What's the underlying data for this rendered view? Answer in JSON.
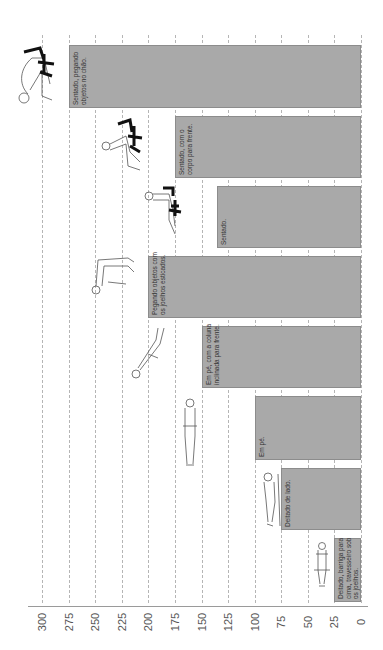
{
  "chart_data": {
    "type": "bar",
    "orientation": "vertical bars, whole figure rotated 90° counter-clockwise",
    "title": "",
    "xlabel": "",
    "ylabel": "",
    "ylim": [
      0,
      300
    ],
    "yticks": [
      0,
      25,
      50,
      75,
      100,
      125,
      150,
      175,
      200,
      225,
      250,
      275,
      300
    ],
    "grid": true,
    "grid_style": "dashed",
    "bar_color": "#a9a9a9",
    "categories": [
      "Deitado, barriga para cima, travesseiro sob os joelhos.",
      "Deitado de lado.",
      "Em pé.",
      "Em pé, com a coluna inclinada para frente.",
      "Pegando objetos com os joelhos esticados.",
      "Sentado.",
      "Sentado, com o corpo para frente.",
      "Sentado, pegando objetos no chão."
    ],
    "values": [
      25,
      75,
      100,
      150,
      200,
      135,
      175,
      275
    ]
  },
  "axis": {
    "ticks": [
      "0",
      "25",
      "50",
      "75",
      "100",
      "125",
      "150",
      "175",
      "200",
      "225",
      "250",
      "275",
      "300"
    ]
  },
  "bars": [
    {
      "label": "Deitado, barriga para\ncima, travesseiro sob\nos joelhos.",
      "value": 25,
      "figure": "lying-on-back-icon"
    },
    {
      "label": "Deitado de lado.",
      "value": 75,
      "figure": "lying-on-side-icon"
    },
    {
      "label": "Em pé.",
      "value": 100,
      "figure": "standing-icon"
    },
    {
      "label": "Em pé, com a coluna\ninclinada para frente.",
      "value": 150,
      "figure": "standing-bent-forward-icon"
    },
    {
      "label": "Pegando objetos com\nos joelhos esticados.",
      "value": 200,
      "figure": "bending-straight-knees-icon"
    },
    {
      "label": "Sentado.",
      "value": 135,
      "figure": "sitting-icon"
    },
    {
      "label": "Sentado, com o\ncorpo para frente.",
      "value": 175,
      "figure": "sitting-leaning-forward-icon"
    },
    {
      "label": "Sentado, pegando\nobjetos no chão.",
      "value": 275,
      "figure": "sitting-picking-floor-icon"
    }
  ]
}
